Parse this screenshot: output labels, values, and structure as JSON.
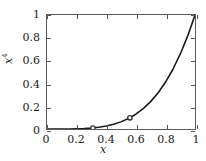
{
  "chart_data": {
    "type": "line",
    "title": "",
    "xlabel": "x",
    "ylabel": "x",
    "ylabel_exponent": "4",
    "xlim": [
      0,
      1
    ],
    "ylim": [
      0,
      1
    ],
    "grid": false,
    "legend": null,
    "line_color": "#1a1a1a",
    "frame_color": "#5a5a5a",
    "marker_color": "#333333",
    "xticks": [
      "0",
      "0.2",
      "0.4",
      "0.6",
      "0.8",
      "1"
    ],
    "xtick_values": [
      0,
      0.2,
      0.4,
      0.6,
      0.8,
      1
    ],
    "yticks": [
      "0",
      "0.2",
      "0.4",
      "0.6",
      "0.8",
      "1"
    ],
    "ytick_values": [
      0,
      0.2,
      0.4,
      0.6,
      0.8,
      1
    ],
    "series": [
      {
        "name": "x^4",
        "kind": "line",
        "x": [
          0,
          0.05,
          0.1,
          0.15,
          0.2,
          0.25,
          0.3,
          0.35,
          0.4,
          0.45,
          0.5,
          0.55,
          0.6,
          0.65,
          0.7,
          0.75,
          0.8,
          0.85,
          0.9,
          0.95,
          1
        ],
        "y": [
          0,
          1e-05,
          0.0001,
          0.0005,
          0.0016,
          0.0039,
          0.0081,
          0.015,
          0.0256,
          0.041,
          0.0625,
          0.0915,
          0.1296,
          0.1785,
          0.2401,
          0.3164,
          0.4096,
          0.522,
          0.6561,
          0.8145,
          1
        ]
      },
      {
        "name": "markers",
        "kind": "scatter",
        "marker": "circle",
        "x": [
          0.31,
          0.56
        ],
        "y": [
          0.009,
          0.098
        ]
      }
    ]
  }
}
